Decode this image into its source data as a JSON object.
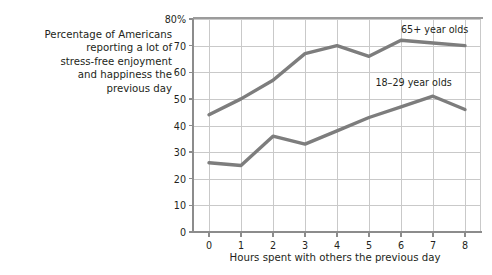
{
  "chart_data": {
    "type": "line",
    "title": "",
    "subtitle": "",
    "ylabel": "Percentage of Americans\nreporting a lot of\nstress-free enjoyment\nand happiness the\nprevious day",
    "xlabel": "Hours spent with others the previous day",
    "x": [
      0,
      1,
      2,
      3,
      4,
      5,
      6,
      7,
      8
    ],
    "xtick_labels": [
      "0",
      "1",
      "2",
      "3",
      "4",
      "5",
      "6",
      "7",
      "8"
    ],
    "ytick_labels": [
      "0",
      "10",
      "20",
      "30",
      "40",
      "50",
      "60",
      "70",
      "80%"
    ],
    "ytick_values": [
      0,
      10,
      20,
      30,
      40,
      50,
      60,
      70,
      80
    ],
    "xlim": [
      -0.5,
      8.5
    ],
    "ylim": [
      0,
      80
    ],
    "grid": true,
    "legend_position": "inline-annotation",
    "series": [
      {
        "name": "65+ year olds",
        "label": "65+ year olds",
        "color": "#7d7d7d",
        "values": [
          44,
          50,
          57,
          67,
          70,
          66,
          72,
          71,
          70
        ],
        "annotation_x": 6,
        "annotation_y": 76
      },
      {
        "name": "18–29 year olds",
        "label": "18–29 year olds",
        "color": "#7d7d7d",
        "values": [
          26,
          25,
          36,
          33,
          38,
          43,
          47,
          51,
          46
        ],
        "annotation_x": 5.2,
        "annotation_y": 56
      }
    ]
  },
  "colors": {
    "background": "#ffffff",
    "text": "#231f20",
    "gridline": "#c9c9c9",
    "axis": "#8c8c8c",
    "line": "#7d7d7d"
  }
}
